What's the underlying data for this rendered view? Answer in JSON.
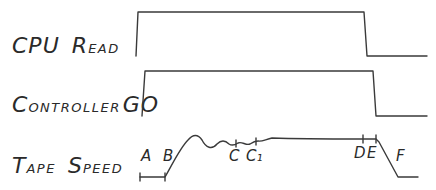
{
  "signals": [
    {
      "id": "cpu-read",
      "label_big": "CPU",
      "label_small_first": "R",
      "label_small_rest": "EAD"
    },
    {
      "id": "controller-go",
      "label_small_first": "C",
      "label_small_rest": "ONTROLLER",
      "label_big": "GO"
    },
    {
      "id": "tape-speed",
      "label_big_first": "T",
      "label_small_first": "APE",
      "label_big_second": "S",
      "label_small_second": "PEED"
    }
  ],
  "points": {
    "A": "A",
    "B": "B",
    "C": "C",
    "C1": "C₁",
    "D": "D",
    "E": "E",
    "F": "F"
  },
  "colors": {
    "ink": "#3a3a3a",
    "background": "#ffffff"
  }
}
